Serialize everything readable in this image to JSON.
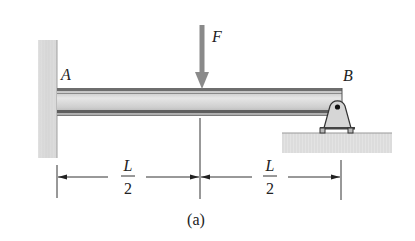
{
  "figure": {
    "caption": "(a)",
    "force": {
      "label": "F",
      "color": "#8a8a8a"
    },
    "points": {
      "left": "A",
      "right": "B"
    },
    "dimensions": [
      {
        "numerator": "L",
        "denominator": "2"
      },
      {
        "numerator": "L",
        "denominator": "2"
      }
    ],
    "supports": {
      "left": "fixed-wall",
      "right": "pin-roller"
    },
    "colors": {
      "beam_dark": "#6e6e6e",
      "beam_light": "#d8d8d8",
      "wall": "#d4d4d4",
      "ground": "#e2e2e2",
      "line": "#333333"
    }
  }
}
